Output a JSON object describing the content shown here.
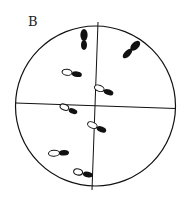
{
  "figure": {
    "panel_label": "B",
    "colors": {
      "line": "#111111",
      "footprint_fill": "#111111",
      "heel_fill": "#ffffff"
    },
    "footprints": [
      {
        "id": 1,
        "type": "solid",
        "x": 84,
        "y": 40,
        "angle": 90
      },
      {
        "id": 2,
        "type": "solid",
        "x": 131,
        "y": 50,
        "angle": 45
      },
      {
        "id": 3,
        "type": "heel-toe",
        "x": 72,
        "y": 73,
        "angle": 8
      },
      {
        "id": 4,
        "type": "heel-toe",
        "x": 104,
        "y": 90,
        "angle": 20
      },
      {
        "id": 5,
        "type": "heel-toe",
        "x": 69,
        "y": 109,
        "angle": 22
      },
      {
        "id": 6,
        "type": "heel-toe",
        "x": 97,
        "y": 127,
        "angle": 22
      },
      {
        "id": 7,
        "type": "heel-toe",
        "x": 59,
        "y": 153,
        "angle": -3
      },
      {
        "id": 8,
        "type": "heel-toe",
        "x": 83,
        "y": 173,
        "angle": 12
      }
    ]
  }
}
